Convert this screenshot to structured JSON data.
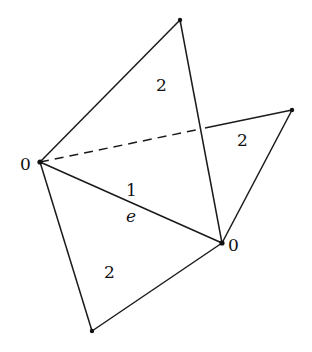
{
  "diagram": {
    "type": "simplicial-complex",
    "vertices": [
      {
        "id": "v_left",
        "x": 40,
        "y": 162,
        "label": "0"
      },
      {
        "id": "v_top",
        "x": 180,
        "y": 20,
        "label": ""
      },
      {
        "id": "v_right",
        "x": 292,
        "y": 110,
        "label": ""
      },
      {
        "id": "v_mid",
        "x": 222,
        "y": 243,
        "label": "0"
      },
      {
        "id": "v_bottom",
        "x": 92,
        "y": 331,
        "label": ""
      }
    ],
    "edges": [
      {
        "from": "v_left",
        "to": "v_top",
        "style": "solid"
      },
      {
        "from": "v_top",
        "to": "v_mid",
        "style": "solid"
      },
      {
        "from": "v_left",
        "to": "v_mid",
        "style": "solid",
        "label": "1",
        "name": "e"
      },
      {
        "from": "v_left",
        "to": "v_bottom",
        "style": "solid"
      },
      {
        "from": "v_bottom",
        "to": "v_mid",
        "style": "solid"
      },
      {
        "from": "v_mid",
        "to": "v_right",
        "style": "solid"
      },
      {
        "from": "v_left",
        "to": "v_right",
        "style": "dashed-then-solid"
      }
    ],
    "labels": {
      "vertex_left": "0",
      "vertex_mid": "0",
      "face_top": "2",
      "face_right": "2",
      "face_bottom": "2",
      "edge_weight": "1",
      "edge_name": "e"
    }
  }
}
